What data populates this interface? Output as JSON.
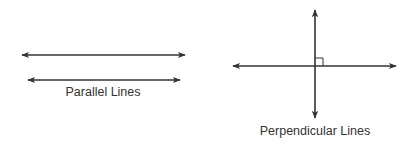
{
  "diagram": {
    "colors": {
      "line": "#333333",
      "background": "#ffffff"
    },
    "parallel": {
      "label": "Parallel Lines",
      "lines": [
        {
          "x1": 22,
          "y1": 55,
          "x2": 185,
          "y2": 55
        },
        {
          "x1": 28,
          "y1": 80,
          "x2": 180,
          "y2": 80
        }
      ]
    },
    "perpendicular": {
      "label": "Perpendicular Lines",
      "horizontal": {
        "x1": 233,
        "y1": 66,
        "x2": 396,
        "y2": 66
      },
      "vertical": {
        "x1": 315,
        "y1": 10,
        "x2": 315,
        "y2": 118
      },
      "right_angle_marker": {
        "x": 315,
        "y": 58,
        "size": 8
      }
    }
  }
}
